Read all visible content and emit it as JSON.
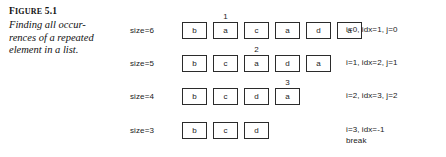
{
  "caption": {
    "figure_prefix": "F",
    "figure_prefix_rest": "IGURE",
    "figure_number": "5.1",
    "lines": [
      "Finding all occur-",
      "rences of a repeated",
      "element in a list."
    ]
  },
  "colors": {
    "background": "#ffffff",
    "box_border": "#2b2b2b",
    "text": "#1a1a1a"
  },
  "diagram": {
    "rows": [
      {
        "size_label": "size=6",
        "cells": [
          "b",
          "a",
          "c",
          "a",
          "d",
          "a"
        ],
        "marker": {
          "text": "1",
          "index": 1
        },
        "state_lines": [
          "i=0, idx=1, j=0"
        ]
      },
      {
        "size_label": "size=5",
        "cells": [
          "b",
          "c",
          "a",
          "d",
          "a"
        ],
        "marker": {
          "text": "2",
          "index": 2
        },
        "state_lines": [
          "i=1, idx=2, j=1"
        ]
      },
      {
        "size_label": "size=4",
        "cells": [
          "b",
          "c",
          "d",
          "a"
        ],
        "marker": {
          "text": "3",
          "index": 3
        },
        "state_lines": [
          "i=2, idx=3, j=2"
        ]
      },
      {
        "size_label": "size=3",
        "cells": [
          "b",
          "c",
          "d"
        ],
        "marker": null,
        "state_lines": [
          "i=3, idx=-1",
          "break"
        ]
      }
    ]
  }
}
